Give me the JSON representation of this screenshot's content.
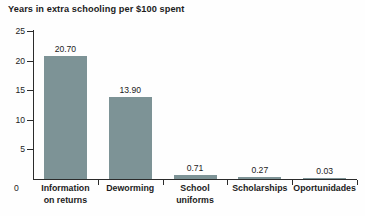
{
  "chart_data": {
    "type": "bar",
    "title": "Years in extra schooling per $100 spent",
    "xlabel": "",
    "ylabel": "",
    "ylim": [
      0,
      25
    ],
    "yticks": [
      0,
      5,
      10,
      15,
      20,
      25
    ],
    "ytick_labels": [
      "0",
      "5",
      "10",
      "15",
      "20",
      "25"
    ],
    "grid": false,
    "legend": false,
    "bar_color": "#7d9396",
    "axis_color": "#2b2b2b",
    "text_color": "#1c1c1c",
    "background_color": "#fefefe",
    "categories": [
      "Information\non returns",
      "Deworming",
      "School\nuniforms",
      "Scholarships",
      "Oportunidades"
    ],
    "values": [
      20.7,
      13.9,
      0.71,
      0.27,
      0.03
    ],
    "value_labels": [
      "20.70",
      "13.90",
      "0.71",
      "0.27",
      "0.03"
    ]
  }
}
